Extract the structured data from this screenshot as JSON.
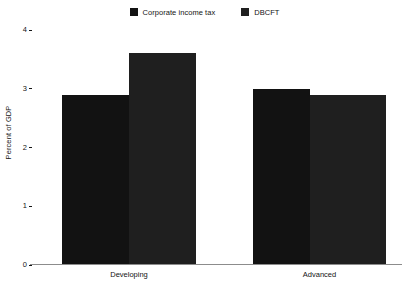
{
  "chart_data": {
    "type": "bar",
    "title": "",
    "xlabel": "",
    "ylabel": "Percent of GDP",
    "categories": [
      "Developing",
      "Advanced"
    ],
    "series": [
      {
        "name": "Corporate income tax",
        "color": "#121212",
        "values": [
          2.9,
          3.0
        ]
      },
      {
        "name": "DBCFT",
        "color": "#1f1f1f",
        "values": [
          3.6,
          2.9
        ]
      }
    ],
    "ylim": [
      0,
      4
    ],
    "yticks": [
      0,
      1,
      2,
      3,
      4
    ],
    "ytick_labels": [
      "0",
      "1",
      "2",
      "3",
      "4"
    ],
    "grid": false,
    "legend_position": "top-center"
  },
  "legend": {
    "entries": [
      {
        "label": "Corporate income tax",
        "color": "#121212"
      },
      {
        "label": "DBCFT",
        "color": "#1f1f1f"
      }
    ]
  },
  "axes": {
    "y_title": "Percent of GDP",
    "y_tick_labels": [
      "4",
      "3",
      "2",
      "1",
      "0"
    ],
    "x_tick_labels": [
      "Developing",
      "Advanced"
    ]
  }
}
